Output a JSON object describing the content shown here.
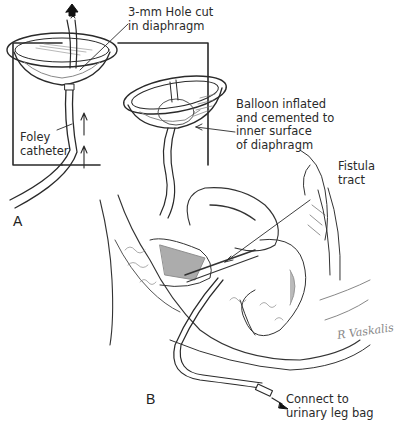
{
  "figure": {
    "panels": [
      {
        "id": "A",
        "label": "A"
      },
      {
        "id": "B",
        "label": "B"
      }
    ],
    "callouts": {
      "hole": [
        "3-mm Hole cut",
        "in diaphragm"
      ],
      "foley": [
        "Foley",
        "catheter"
      ],
      "balloon": [
        "Balloon inflated",
        "and cemented to",
        "inner surface",
        "of diaphragm"
      ],
      "fistula": [
        "Fistula",
        "tract"
      ],
      "connect": [
        "Connect to",
        "urinary leg bag"
      ]
    },
    "signature": "R Vaskalis",
    "colors": {
      "ink": "#2a2a2a",
      "shade": "#7a7a7a",
      "background": "#ffffff"
    }
  }
}
